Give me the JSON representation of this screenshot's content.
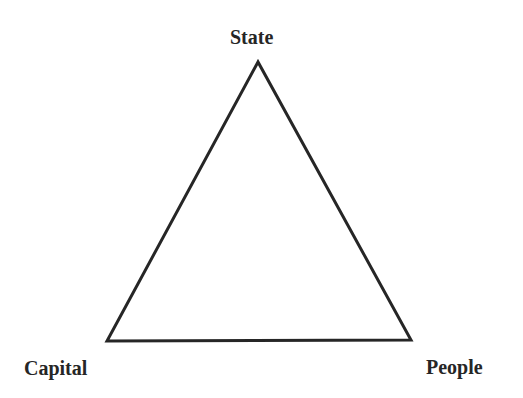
{
  "diagram": {
    "type": "triangle",
    "stroke_color": "#262626",
    "nodes": [
      {
        "id": "state",
        "label": "State",
        "position": "top"
      },
      {
        "id": "capital",
        "label": "Capital",
        "position": "bottom-left"
      },
      {
        "id": "people",
        "label": "People",
        "position": "bottom-right"
      }
    ],
    "edges": [
      {
        "from": "state",
        "to": "capital"
      },
      {
        "from": "capital",
        "to": "people"
      },
      {
        "from": "people",
        "to": "state"
      }
    ]
  }
}
